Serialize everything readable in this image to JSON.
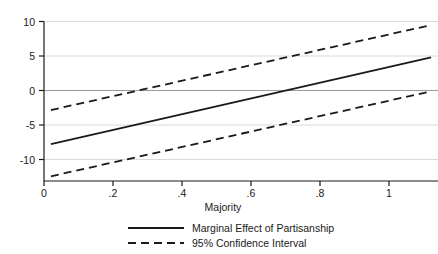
{
  "chart_data": {
    "type": "line",
    "title": "",
    "xlabel": "Majority",
    "ylabel": "",
    "xlim": [
      -0.02,
      1.12
    ],
    "ylim": [
      -13.6,
      13.6
    ],
    "xticks": [
      0,
      0.2,
      0.4,
      0.6,
      0.8,
      1
    ],
    "xticklabels": [
      "0",
      ".2",
      ".4",
      ".6",
      ".8",
      "1"
    ],
    "yticks": [
      -10,
      -5,
      0,
      5,
      10
    ],
    "yticklabels": [
      "-10",
      "-5",
      "0",
      "5",
      "10"
    ],
    "grid": "horizontal",
    "grid_color": "#d9d9d9",
    "axis_color": "#1a1a1a",
    "line_color": "#1a1a1a",
    "legend_position": "bottom-center",
    "series": [
      {
        "name": "Marginal Effect of Partisanship",
        "style": "solid",
        "x": [
          0,
          1.1
        ],
        "values": [
          -7.3,
          7.5
        ]
      },
      {
        "name": "95% Confidence Interval",
        "style": "dashed",
        "bound": "upper",
        "x": [
          0,
          1.1
        ],
        "values": [
          -1.5,
          13.0
        ]
      },
      {
        "name": "95% Confidence Interval",
        "style": "dashed",
        "bound": "lower",
        "x": [
          0,
          1.1
        ],
        "values": [
          -12.8,
          1.7
        ]
      }
    ],
    "zero_reference_line": 0,
    "legend": [
      {
        "label": "Marginal Effect of Partisanship",
        "style": "solid"
      },
      {
        "label": "95% Confidence Interval",
        "style": "dashed"
      }
    ]
  }
}
